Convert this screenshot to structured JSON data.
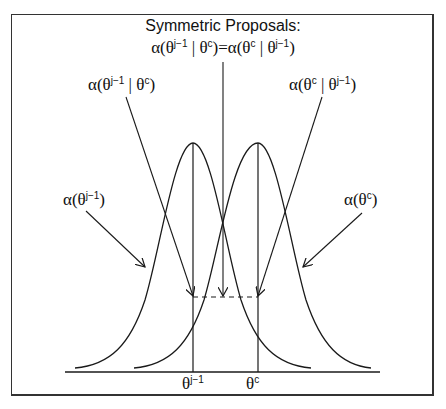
{
  "title": "Symmetric Proposals:",
  "equation": {
    "lhs_alpha": "α(θ",
    "lhs_sup1": "j−1",
    "lhs_mid": " | θ",
    "lhs_sup2": "c",
    "eq": ")=α(θ",
    "rhs_sup1": "c",
    "rhs_mid": " | θ",
    "rhs_sup2": "j−1",
    "close": ")"
  },
  "labels": {
    "alpha_prev_given_c": {
      "pre": "α(θ",
      "sup1": "j−1",
      "mid": " | θ",
      "sup2": "c",
      "post": ")"
    },
    "alpha_c_given_prev": {
      "pre": "α(θ",
      "sup1": "c",
      "mid": " | θ",
      "sup2": "j−1",
      "post": ")"
    },
    "alpha_prev": {
      "pre": "α(θ",
      "sup": "j−1",
      "post": ")"
    },
    "alpha_c": {
      "pre": "α(θ",
      "sup": "c",
      "post": ")"
    }
  },
  "axis": {
    "theta_prev": {
      "base": "θ",
      "sup": "j−1"
    },
    "theta_c": {
      "base": "θ",
      "sup": "c"
    }
  },
  "colors": {
    "stroke": "#1a1a1a",
    "background": "#ffffff",
    "frame": "#333333"
  }
}
